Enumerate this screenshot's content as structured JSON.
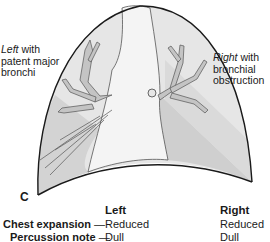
{
  "figure": {
    "panel_label": "C",
    "left_label": {
      "italic": "Left",
      "rest_line1": " with",
      "line2": "patent major",
      "line3": "bronchi"
    },
    "right_label": {
      "italic": "Right",
      "rest_line1": " with",
      "line2": "bronchial",
      "line3": "obstruction"
    },
    "colors": {
      "outline": "#1a1a1a",
      "lung_fill": "#e6e6e6",
      "dark_fill": "#cfcfcf",
      "mediastinum": "#f4f4f4",
      "bronchi": "#bdbdbd"
    }
  },
  "table": {
    "col_left": "Left",
    "col_right": "Right",
    "rows": [
      {
        "label": "Chest expansion",
        "dash": "—",
        "left": "Reduced",
        "right": "Reduced"
      },
      {
        "label": "Percussion note",
        "dash": "—",
        "left": "Dull",
        "right": "Dull"
      }
    ]
  }
}
